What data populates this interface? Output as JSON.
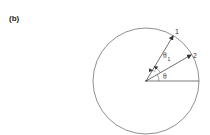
{
  "figure": {
    "panel_label": "(b)",
    "vector_labels": [
      "1",
      "2"
    ],
    "angle_labels": {
      "theta": "θ",
      "theta1_symbol": "θ",
      "theta1_subscript": "1"
    },
    "colors": {
      "stroke": "#333333",
      "background": "#ffffff"
    }
  }
}
